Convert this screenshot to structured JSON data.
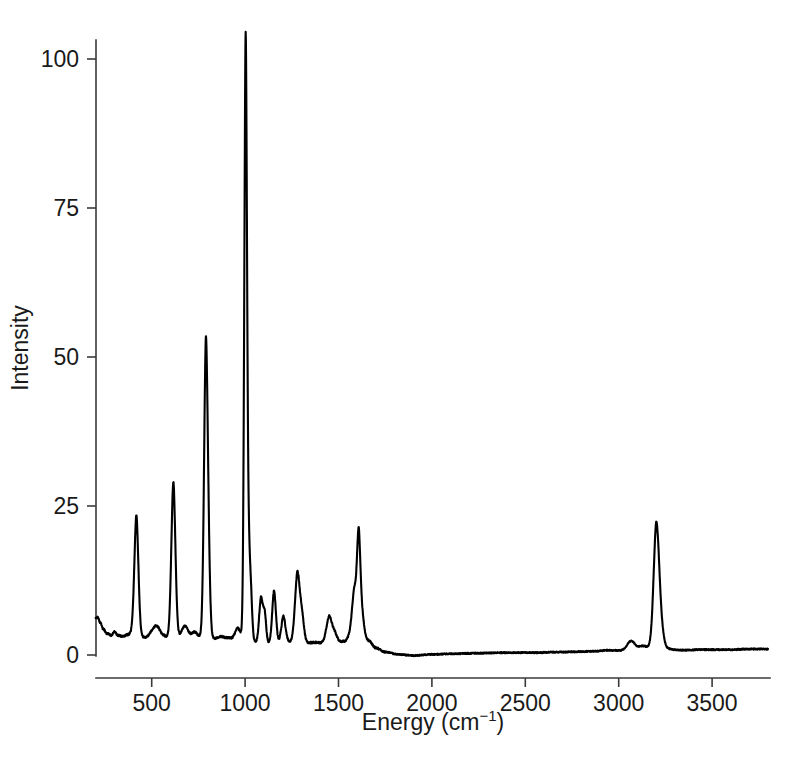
{
  "figure": {
    "background_color": "#ffffff",
    "line_color": "#000000",
    "axis_color": "#3a3a3a",
    "title": ""
  },
  "axes": {
    "x_title_main": "Energy (cm",
    "x_title_sup": "−1",
    "x_title_close": ")",
    "x_title_full": "Energy (cm−1)",
    "y_title": "Intensity",
    "x_ticks": [
      "500",
      "1000",
      "1500",
      "2000",
      "2500",
      "3000",
      "3500"
    ],
    "y_ticks": [
      "0",
      "25",
      "50",
      "75",
      "100"
    ]
  },
  "chart_data": {
    "type": "line",
    "title": "",
    "xlabel": "Energy (cm−1)",
    "ylabel": "Intensity",
    "xlim": [
      200,
      3800
    ],
    "ylim": [
      -2,
      104
    ],
    "grid": false,
    "legend": "none",
    "x_tick_values": [
      500,
      1000,
      1500,
      2000,
      2500,
      3000,
      3500
    ],
    "y_tick_values": [
      0,
      25,
      50,
      75,
      100
    ],
    "series_name": "Raman spectrum",
    "baseline_profile": [
      {
        "x": 210,
        "y": 6.3
      },
      {
        "x": 225,
        "y": 5.4
      },
      {
        "x": 240,
        "y": 4.4
      },
      {
        "x": 260,
        "y": 3.6
      },
      {
        "x": 285,
        "y": 3.3
      },
      {
        "x": 300,
        "y": 3.9
      },
      {
        "x": 320,
        "y": 3.3
      },
      {
        "x": 345,
        "y": 3.1
      },
      {
        "x": 370,
        "y": 3.4
      },
      {
        "x": 395,
        "y": 3.6
      },
      {
        "x": 440,
        "y": 3.0
      },
      {
        "x": 470,
        "y": 2.9
      },
      {
        "x": 500,
        "y": 3.3
      },
      {
        "x": 530,
        "y": 3.7
      },
      {
        "x": 560,
        "y": 3.2
      },
      {
        "x": 590,
        "y": 2.9
      },
      {
        "x": 640,
        "y": 3.0
      },
      {
        "x": 670,
        "y": 3.4
      },
      {
        "x": 700,
        "y": 3.0
      },
      {
        "x": 730,
        "y": 2.8
      },
      {
        "x": 760,
        "y": 2.9
      },
      {
        "x": 830,
        "y": 2.7
      },
      {
        "x": 870,
        "y": 3.1
      },
      {
        "x": 900,
        "y": 2.9
      },
      {
        "x": 940,
        "y": 2.7
      },
      {
        "x": 975,
        "y": 2.8
      },
      {
        "x": 1030,
        "y": 2.6
      },
      {
        "x": 1070,
        "y": 1.9
      },
      {
        "x": 1105,
        "y": 1.9
      },
      {
        "x": 1165,
        "y": 2.0
      },
      {
        "x": 1215,
        "y": 2.3
      },
      {
        "x": 1250,
        "y": 2.1
      },
      {
        "x": 1320,
        "y": 2.0
      },
      {
        "x": 1380,
        "y": 2.1
      },
      {
        "x": 1420,
        "y": 2.0
      },
      {
        "x": 1480,
        "y": 2.0
      },
      {
        "x": 1530,
        "y": 2.3
      },
      {
        "x": 1560,
        "y": 3.0
      },
      {
        "x": 1660,
        "y": 2.4
      },
      {
        "x": 1700,
        "y": 1.2
      },
      {
        "x": 1750,
        "y": 0.5
      },
      {
        "x": 1820,
        "y": 0.1
      },
      {
        "x": 1900,
        "y": -0.1
      },
      {
        "x": 2000,
        "y": 0.1
      },
      {
        "x": 2100,
        "y": 0.2
      },
      {
        "x": 2250,
        "y": 0.3
      },
      {
        "x": 2400,
        "y": 0.4
      },
      {
        "x": 2550,
        "y": 0.4
      },
      {
        "x": 2700,
        "y": 0.5
      },
      {
        "x": 2850,
        "y": 0.6
      },
      {
        "x": 2950,
        "y": 0.8
      },
      {
        "x": 3030,
        "y": 0.7
      },
      {
        "x": 3090,
        "y": 1.0
      },
      {
        "x": 3130,
        "y": 1.5
      },
      {
        "x": 3160,
        "y": 1.3
      },
      {
        "x": 3260,
        "y": 1.0
      },
      {
        "x": 3330,
        "y": 0.8
      },
      {
        "x": 3450,
        "y": 0.9
      },
      {
        "x": 3600,
        "y": 0.9
      },
      {
        "x": 3700,
        "y": 1.0
      },
      {
        "x": 3800,
        "y": 1.0
      }
    ],
    "peaks": [
      {
        "center": 418,
        "height": 19.0,
        "width": 11,
        "label": "418"
      },
      {
        "center": 520,
        "height": 1.2,
        "width": 22,
        "label": "520"
      },
      {
        "center": 616,
        "height": 24.6,
        "width": 11,
        "label": "616"
      },
      {
        "center": 680,
        "height": 1.5,
        "width": 16,
        "label": "680"
      },
      {
        "center": 730,
        "height": 1.0,
        "width": 14,
        "label": "730"
      },
      {
        "center": 790,
        "height": 45.9,
        "width": 10,
        "label": "790"
      },
      {
        "center": 805,
        "height": 7.5,
        "width": 9,
        "label": "805"
      },
      {
        "center": 960,
        "height": 1.6,
        "width": 14,
        "label": "960"
      },
      {
        "center": 1003,
        "height": 94.8,
        "width": 7.5,
        "label": "1003"
      },
      {
        "center": 1020,
        "height": 12.0,
        "width": 8,
        "label": "1020"
      },
      {
        "center": 1032,
        "height": 5.0,
        "width": 7,
        "label": "1032"
      },
      {
        "center": 1085,
        "height": 7.2,
        "width": 10,
        "label": "1085"
      },
      {
        "center": 1105,
        "height": 4.5,
        "width": 8,
        "label": "1105"
      },
      {
        "center": 1155,
        "height": 8.3,
        "width": 10,
        "label": "1155"
      },
      {
        "center": 1205,
        "height": 4.0,
        "width": 11,
        "label": "1205"
      },
      {
        "center": 1280,
        "height": 11.0,
        "width": 13,
        "label": "1280"
      },
      {
        "center": 1305,
        "height": 3.8,
        "width": 11,
        "label": "1305"
      },
      {
        "center": 1450,
        "height": 4.2,
        "width": 15,
        "label": "1450"
      },
      {
        "center": 1480,
        "height": 1.4,
        "width": 13,
        "label": "1480"
      },
      {
        "center": 1585,
        "height": 7.5,
        "width": 13,
        "label": "1585"
      },
      {
        "center": 1608,
        "height": 14.8,
        "width": 9,
        "label": "1608"
      },
      {
        "center": 1625,
        "height": 4.0,
        "width": 12,
        "label": "1625"
      },
      {
        "center": 3065,
        "height": 1.4,
        "width": 22,
        "label": "3065"
      },
      {
        "center": 3200,
        "height": 15.7,
        "width": 14,
        "label": "3200"
      },
      {
        "center": 3215,
        "height": 6.0,
        "width": 18,
        "label": "3215"
      }
    ],
    "annotations": []
  },
  "geometry": {
    "plot_left_px": 96,
    "plot_right_px": 770,
    "plot_bottom_px": 656,
    "plot_top_px": 40,
    "x_zero_px": 58.3,
    "px_per_wavenumber": 0.1868,
    "y_zero_px": 655,
    "px_per_intensity": 5.96
  }
}
